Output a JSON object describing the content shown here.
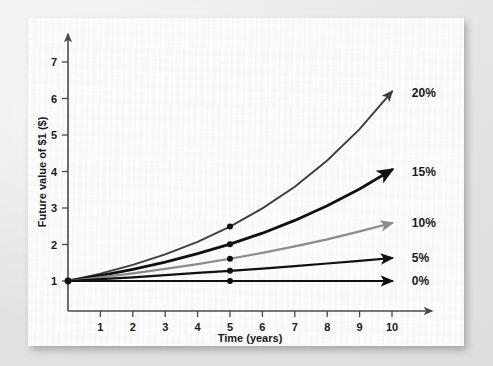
{
  "figure": {
    "background_color": "#e8e8e8",
    "card_color": "#fdfdfd"
  },
  "chart_data": {
    "type": "line",
    "title": "",
    "subtitle": "",
    "xlabel": "Time (years)",
    "ylabel": "Future value of $1 ($)",
    "xlim": [
      0,
      10.6
    ],
    "ylim": [
      0,
      7.6
    ],
    "xticks": [
      1,
      2,
      3,
      4,
      5,
      6,
      7,
      8,
      9,
      10
    ],
    "xtick_labels": [
      "1",
      "2",
      "3",
      "4",
      "5",
      "6",
      "7",
      "8",
      "9",
      "10"
    ],
    "yticks": [
      1,
      2,
      3,
      4,
      5,
      6,
      7
    ],
    "ytick_labels": [
      "1",
      "2",
      "3",
      "4",
      "5",
      "6",
      "7"
    ],
    "grid": false,
    "legend_position": "right-end-of-line",
    "x": [
      0,
      1,
      2,
      3,
      4,
      5,
      6,
      7,
      8,
      9,
      10
    ],
    "series": [
      {
        "name": "20%",
        "label": "20%",
        "rate": 0.2,
        "color": "#3d3d3d",
        "line_width": 1.9,
        "values": [
          1.0,
          1.2,
          1.44,
          1.73,
          2.07,
          2.49,
          2.99,
          3.58,
          4.3,
          5.16,
          6.19
        ],
        "marker_at_year5": 2.49,
        "label_x": 10.55,
        "label_y": 6.15
      },
      {
        "name": "15%",
        "label": "15%",
        "rate": 0.15,
        "color": "#101010",
        "line_width": 2.8,
        "values": [
          1.0,
          1.15,
          1.32,
          1.52,
          1.75,
          2.01,
          2.31,
          2.66,
          3.06,
          3.52,
          4.05
        ],
        "marker_at_year5": 2.01,
        "label_x": 10.55,
        "label_y": 4.0
      },
      {
        "name": "10%",
        "label": "10%",
        "rate": 0.1,
        "color": "#8c8c8c",
        "line_width": 2.2,
        "values": [
          1.0,
          1.1,
          1.21,
          1.33,
          1.46,
          1.61,
          1.77,
          1.95,
          2.14,
          2.36,
          2.59
        ],
        "marker_at_year5": 1.61,
        "label_x": 10.55,
        "label_y": 2.58
      },
      {
        "name": "5%",
        "label": "5%",
        "rate": 0.05,
        "color": "#101010",
        "line_width": 2.2,
        "values": [
          1.0,
          1.05,
          1.1,
          1.16,
          1.22,
          1.28,
          1.34,
          1.41,
          1.48,
          1.55,
          1.63
        ],
        "marker_at_year5": 1.28,
        "label_x": 10.55,
        "label_y": 1.62
      },
      {
        "name": "0%",
        "label": "0%",
        "rate": 0.0,
        "color": "#101010",
        "line_width": 2.2,
        "values": [
          1.0,
          1.0,
          1.0,
          1.0,
          1.0,
          1.0,
          1.0,
          1.0,
          1.0,
          1.0,
          1.0
        ],
        "marker_at_year5": 1.0,
        "label_x": 10.55,
        "label_y": 1.0
      }
    ],
    "markers": {
      "at_x": 5,
      "color": "#101010",
      "radius": 3.0
    },
    "axis_color": "#4a4a4a",
    "arrow_heads": true
  }
}
